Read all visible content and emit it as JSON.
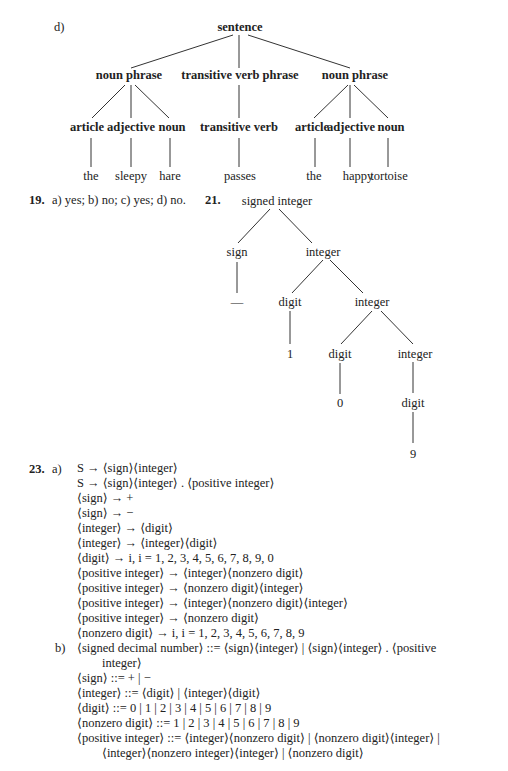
{
  "part_d": {
    "label": "d)",
    "tree": {
      "root": "sentence",
      "level2": [
        "noun phrase",
        "transitive verb phrase",
        "noun phrase"
      ],
      "level3": [
        "article",
        "adjective",
        "noun",
        "transitive verb",
        "article",
        "adjective",
        "noun"
      ],
      "leaves": [
        "the",
        "sleepy",
        "hare",
        "passes",
        "the",
        "happy",
        "tortoise"
      ]
    }
  },
  "ex19": {
    "number": "19.",
    "answer": "a) yes; b) no; c) yes; d) no."
  },
  "ex21": {
    "number": "21.",
    "tree": {
      "root": "signed integer",
      "sign": "sign",
      "integer1": "integer",
      "minus": "—",
      "digit1": "digit",
      "integer2": "integer",
      "one": "1",
      "digit2": "digit",
      "integer3": "integer",
      "zero": "0",
      "digit3": "digit",
      "nine": "9"
    }
  },
  "ex23": {
    "number": "23.",
    "part_a_label": "a)",
    "part_a": [
      "S → ⟨sign⟩⟨integer⟩",
      "S → ⟨sign⟩⟨integer⟩ . ⟨positive integer⟩",
      "⟨sign⟩ → +",
      "⟨sign⟩ → −",
      "⟨integer⟩ → ⟨digit⟩",
      "⟨integer⟩ → ⟨integer⟩⟨digit⟩",
      "⟨digit⟩ → i, i = 1, 2, 3, 4, 5, 6, 7, 8, 9, 0",
      "⟨positive integer⟩ → ⟨integer⟩⟨nonzero digit⟩",
      "⟨positive integer⟩ → ⟨nonzero digit⟩⟨integer⟩",
      "⟨positive integer⟩ → ⟨integer⟩⟨nonzero digit⟩⟨integer⟩",
      "⟨positive integer⟩ → ⟨nonzero digit⟩",
      "⟨nonzero digit⟩ → i, i = 1, 2, 3, 4, 5, 6, 7, 8, 9"
    ],
    "part_b_label": "b)",
    "part_b": [
      "⟨signed decimal number⟩ ::= ⟨sign⟩⟨integer⟩ | ⟨sign⟩⟨integer⟩ . ⟨positive",
      "integer⟩",
      "⟨sign⟩ ::= + | −",
      "⟨integer⟩ ::= ⟨digit⟩ | ⟨integer⟩⟨digit⟩",
      "⟨digit⟩ ::= 0 | 1 | 2 | 3 | 4 | 5 | 6 | 7 | 8 | 9",
      "⟨nonzero digit⟩ ::= 1 | 2 | 3 | 4 | 5 | 6 | 7 | 8 | 9",
      "⟨positive integer⟩ ::= ⟨integer⟩⟨nonzero digit⟩ | ⟨nonzero digit⟩⟨integer⟩ |",
      "⟨integer⟩⟨nonzero integer⟩⟨integer⟩ | ⟨nonzero digit⟩"
    ]
  }
}
